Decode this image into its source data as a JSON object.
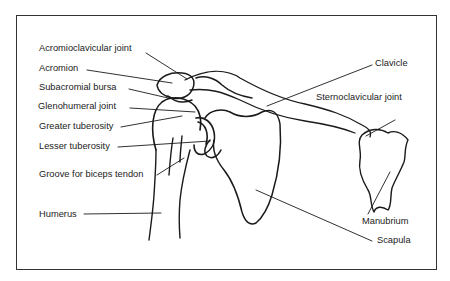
{
  "figure": {
    "labels": [
      {
        "id": "acromioclavicular-joint",
        "text": "Acromioclavicular joint",
        "x": 39,
        "y": 44
      },
      {
        "id": "acromion",
        "text": "Acromion",
        "x": 39,
        "y": 64
      },
      {
        "id": "subacromial-bursa",
        "text": "Subacromial bursa",
        "x": 39,
        "y": 83
      },
      {
        "id": "glenohumeral-joint",
        "text": "Glenohumeral joint",
        "x": 38,
        "y": 102
      },
      {
        "id": "greater-tuberosity",
        "text": "Greater tuberosity",
        "x": 39,
        "y": 122
      },
      {
        "id": "lesser-tuberosity",
        "text": "Lesser tuberosity",
        "x": 39,
        "y": 142
      },
      {
        "id": "groove-for-biceps-tendon",
        "text": "Groove for biceps tendon",
        "x": 39,
        "y": 170
      },
      {
        "id": "humerus",
        "text": "Humerus",
        "x": 39,
        "y": 210
      },
      {
        "id": "clavicle",
        "text": "Clavicle",
        "x": 375,
        "y": 59
      },
      {
        "id": "sternoclavicular-joint",
        "text": "Sternoclavicular joint",
        "x": 316,
        "y": 93
      },
      {
        "id": "manubrium",
        "text": "Manubrium",
        "x": 362,
        "y": 217
      },
      {
        "id": "scapula",
        "text": "Scapula",
        "x": 377,
        "y": 236
      }
    ],
    "colors": {
      "line": "#1a1a1a",
      "text": "#222222",
      "background": "#ffffff"
    }
  }
}
